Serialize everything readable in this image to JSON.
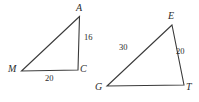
{
  "figure": {
    "background_color": "#ffffff",
    "stroke_color": "#3a3a3a",
    "text_color": "#2b2b2b",
    "stroke_width": 1.1,
    "width": 199,
    "height": 102,
    "shapes": [
      {
        "name": "triangle-mac",
        "vertices": [
          {
            "label": "A",
            "x": 79.5,
            "y": 16.5,
            "label_x": 76,
            "label_y": 3
          },
          {
            "label": "M",
            "x": 21.5,
            "y": 71.0,
            "label_x": 8,
            "label_y": 64
          },
          {
            "label": "C",
            "x": 78.0,
            "y": 70.0,
            "label_x": 80,
            "label_y": 64
          }
        ],
        "sides": [
          {
            "name": "side-ac",
            "value": "16",
            "label_x": 84,
            "label_y": 33
          },
          {
            "name": "side-mc",
            "value": "20",
            "label_x": 45,
            "label_y": 74
          }
        ]
      },
      {
        "name": "triangle-get",
        "vertices": [
          {
            "label": "E",
            "x": 172.0,
            "y": 25.0,
            "label_x": 168,
            "label_y": 11
          },
          {
            "label": "G",
            "x": 107.0,
            "y": 86.0,
            "label_x": 95,
            "label_y": 82
          },
          {
            "label": "T",
            "x": 184.0,
            "y": 85.0,
            "label_x": 186,
            "label_y": 82
          }
        ],
        "sides": [
          {
            "name": "side-ge",
            "value": "30",
            "label_x": 119,
            "label_y": 43
          },
          {
            "name": "side-et",
            "value": "20",
            "label_x": 176,
            "label_y": 47
          }
        ]
      }
    ]
  }
}
